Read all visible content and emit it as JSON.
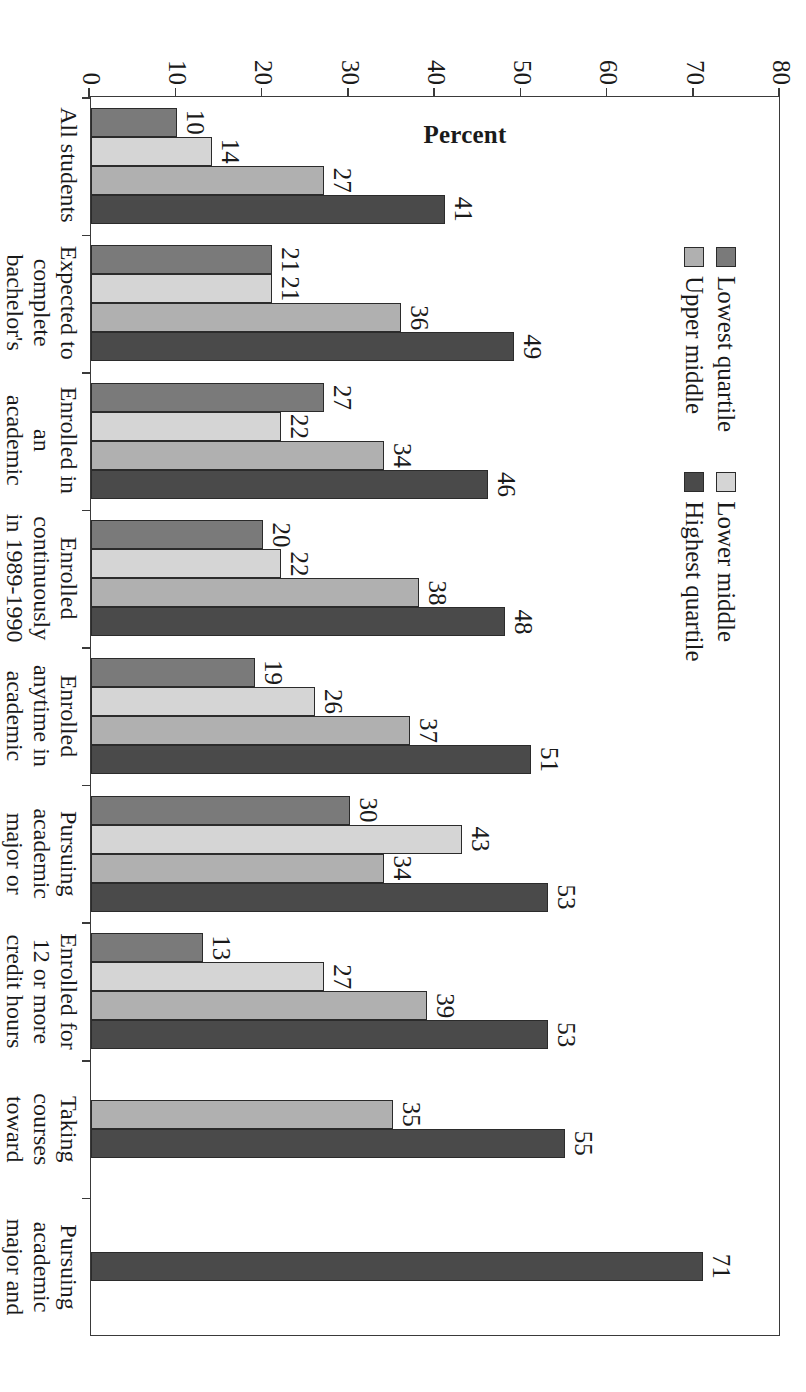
{
  "chart_data": {
    "type": "bar",
    "orientation": "vertical",
    "title": "",
    "xlabel": "",
    "ylabel": "Percent",
    "ylim": [
      0,
      80
    ],
    "yticks": [
      80,
      70,
      60,
      50,
      40,
      30,
      20,
      10,
      0
    ],
    "grid": false,
    "legend_position": "top-left",
    "series": [
      {
        "name": "Lowest quartile",
        "color": "#7a7a7a"
      },
      {
        "name": "Lower middle",
        "color": "#d5d5d5"
      },
      {
        "name": "Upper middle",
        "color": "#b0b0b0"
      },
      {
        "name": "Highest quartile",
        "color": "#4a4a4a"
      }
    ],
    "categories": [
      "All students",
      "Expected to\ncomplete\nbachelor's\ndegree or\nhigher",
      "Enrolled in an\nacademic\nprogram",
      "Enrolled\ncontinuously\nin 1989-1990",
      "Enrolled\nanytime in\nacademic\nyear 1990-1991",
      "Pursuing\nacademic\nmajor or\ntaking\ncourses\ntoward\nbachelor's or\nboth",
      "Enrolled for\n12 or more\ncredit hours",
      "Taking courses\ntoward\nbachelor's",
      "Pursuing academic\nmajor and taking\ncourses\ntoward bachelor's"
    ],
    "groups": [
      {
        "category": "All students",
        "values": [
          10,
          14,
          27,
          41
        ]
      },
      {
        "category": "Expected to complete bachelor's degree or higher",
        "values": [
          21,
          21,
          36,
          49
        ]
      },
      {
        "category": "Enrolled in an academic program",
        "values": [
          27,
          22,
          34,
          46
        ]
      },
      {
        "category": "Enrolled continuously in 1989-1990",
        "values": [
          20,
          22,
          38,
          48
        ]
      },
      {
        "category": "Enrolled anytime in academic year 1990-1991",
        "values": [
          19,
          26,
          37,
          51
        ]
      },
      {
        "category": "Pursuing academic major or taking courses toward bachelor's or both",
        "values": [
          30,
          43,
          34,
          53
        ]
      },
      {
        "category": "Enrolled for 12 or more credit hours",
        "values": [
          13,
          27,
          39,
          53
        ]
      },
      {
        "category": "Taking courses toward bachelor's",
        "values": [
          null,
          null,
          35,
          55
        ]
      },
      {
        "category": "Pursuing academic major and taking courses toward bachelor's",
        "values": [
          null,
          null,
          null,
          71
        ]
      }
    ]
  },
  "legend": {
    "columns": [
      [
        {
          "label": "Lowest quartile",
          "color": "#7a7a7a"
        },
        {
          "label": "Upper middle",
          "color": "#b0b0b0"
        }
      ],
      [
        {
          "label": "Lower middle",
          "color": "#d5d5d5"
        },
        {
          "label": "Highest quartile",
          "color": "#4a4a4a"
        }
      ]
    ]
  },
  "axis": {
    "y_title": "Percent",
    "y_ticks": [
      "80",
      "70",
      "60",
      "50",
      "40",
      "30",
      "20",
      "10",
      "0"
    ]
  },
  "caption": ""
}
